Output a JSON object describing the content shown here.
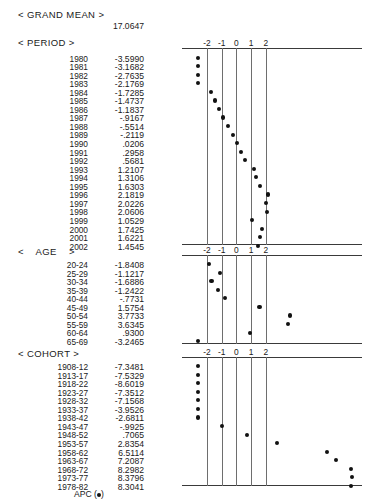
{
  "report": {
    "grand_mean_label": "< GRAND MEAN >",
    "grand_mean_value": "17.0647",
    "legend_label": "APC (",
    "legend_suffix": ")"
  },
  "axis": {
    "ticks": [
      "-2",
      "-1",
      "0",
      "1",
      "2"
    ],
    "tick_values": [
      -2,
      -1,
      0,
      1,
      2
    ],
    "min": -2,
    "max": 2
  },
  "sections": [
    {
      "title": "< PERIOD >",
      "rows": [
        {
          "label": "1980",
          "value": "-3.5990",
          "num": -3.599
        },
        {
          "label": "1981",
          "value": "-3.1682",
          "num": -3.1682
        },
        {
          "label": "1982",
          "value": "-2.7635",
          "num": -2.7635
        },
        {
          "label": "1983",
          "value": "-2.1769",
          "num": -2.1769
        },
        {
          "label": "1984",
          "value": "-1.7285",
          "num": -1.7285
        },
        {
          "label": "1985",
          "value": "-1.4737",
          "num": -1.4737
        },
        {
          "label": "1986",
          "value": "-1.1837",
          "num": -1.1837
        },
        {
          "label": "1987",
          "value": "-.9167",
          "num": -0.9167
        },
        {
          "label": "1988",
          "value": "-.5514",
          "num": -0.5514
        },
        {
          "label": "1989",
          "value": "-.2119",
          "num": -0.2119
        },
        {
          "label": "1990",
          "value": ".0206",
          "num": 0.0206
        },
        {
          "label": "1991",
          "value": ".2958",
          "num": 0.2958
        },
        {
          "label": "1992",
          "value": ".5681",
          "num": 0.5681
        },
        {
          "label": "1993",
          "value": "1.2107",
          "num": 1.2107
        },
        {
          "label": "1994",
          "value": "1.3106",
          "num": 1.3106
        },
        {
          "label": "1995",
          "value": "1.6303",
          "num": 1.6303
        },
        {
          "label": "1996",
          "value": "2.1819",
          "num": 2.1819
        },
        {
          "label": "1997",
          "value": "2.0226",
          "num": 2.0226
        },
        {
          "label": "1998",
          "value": "2.0606",
          "num": 2.0606
        },
        {
          "label": "1999",
          "value": "1.0529",
          "num": 1.0529
        },
        {
          "label": "2000",
          "value": "1.7425",
          "num": 1.7425
        },
        {
          "label": "2001",
          "value": "1.6221",
          "num": 1.6221
        },
        {
          "label": "2002",
          "value": "1.4545",
          "num": 1.4545
        }
      ]
    },
    {
      "title_left": "<",
      "title_mid": "AGE",
      "title_right": ">",
      "title": "<    AGE    >",
      "rows": [
        {
          "label": "20-24",
          "value": "-1.8408",
          "num": -1.8408
        },
        {
          "label": "25-29",
          "value": "-1.1217",
          "num": -1.1217
        },
        {
          "label": "30-34",
          "value": "-1.6886",
          "num": -1.6886
        },
        {
          "label": "35-39",
          "value": "-1.2422",
          "num": -1.2422
        },
        {
          "label": "40-44",
          "value": "-.7731",
          "num": -0.7731
        },
        {
          "label": "45-49",
          "value": "1.5754",
          "num": 1.5754
        },
        {
          "label": "50-54",
          "value": "3.7733",
          "num": 3.7733
        },
        {
          "label": "55-59",
          "value": "3.6345",
          "num": 3.6345
        },
        {
          "label": "60-64",
          "value": ".9300",
          "num": 0.93
        },
        {
          "label": "65-69",
          "value": "-3.2465",
          "num": -3.2465
        }
      ]
    },
    {
      "title": "< COHORT >",
      "rows": [
        {
          "label": "1908-12",
          "value": "-7.3481",
          "num": -7.3481
        },
        {
          "label": "1913-17",
          "value": "-7.5329",
          "num": -7.5329
        },
        {
          "label": "1918-22",
          "value": "-8.6019",
          "num": -8.6019
        },
        {
          "label": "1923-27",
          "value": "-7.3512",
          "num": -7.3512
        },
        {
          "label": "1928-32",
          "value": "-7.1568",
          "num": -7.1568
        },
        {
          "label": "1933-37",
          "value": "-3.9526",
          "num": -3.9526
        },
        {
          "label": "1938-42",
          "value": "-2.6811",
          "num": -2.6811
        },
        {
          "label": "1943-47",
          "value": "-.9925",
          "num": -0.9925
        },
        {
          "label": "1948-52",
          "value": ".7065",
          "num": 0.7065
        },
        {
          "label": "1953-57",
          "value": "2.8354",
          "num": 2.8354
        },
        {
          "label": "1958-62",
          "value": "6.5114",
          "num": 6.5114
        },
        {
          "label": "1963-67",
          "value": "7.2087",
          "num": 7.2087
        },
        {
          "label": "1968-72",
          "value": "8.2982",
          "num": 8.2982
        },
        {
          "label": "1973-77",
          "value": "8.3796",
          "num": 8.3796
        },
        {
          "label": "1978-82",
          "value": "8.3041",
          "num": 8.3041
        }
      ]
    }
  ],
  "chart_data": {
    "type": "scatter",
    "xlabel": "",
    "ylabel": "",
    "xlim": [
      -2,
      2
    ],
    "grid": true,
    "legend": "APC",
    "series": [
      {
        "name": "PERIOD",
        "categories": [
          "1980",
          "1981",
          "1982",
          "1983",
          "1984",
          "1985",
          "1986",
          "1987",
          "1988",
          "1989",
          "1990",
          "1991",
          "1992",
          "1993",
          "1994",
          "1995",
          "1996",
          "1997",
          "1998",
          "1999",
          "2000",
          "2001",
          "2002"
        ],
        "values": [
          -3.599,
          -3.1682,
          -2.7635,
          -2.1769,
          -1.7285,
          -1.4737,
          -1.1837,
          -0.9167,
          -0.5514,
          -0.2119,
          0.0206,
          0.2958,
          0.5681,
          1.2107,
          1.3106,
          1.6303,
          2.1819,
          2.0226,
          2.0606,
          1.0529,
          1.7425,
          1.6221,
          1.4545
        ]
      },
      {
        "name": "AGE",
        "categories": [
          "20-24",
          "25-29",
          "30-34",
          "35-39",
          "40-44",
          "45-49",
          "50-54",
          "55-59",
          "60-64",
          "65-69"
        ],
        "values": [
          -1.8408,
          -1.1217,
          -1.6886,
          -1.2422,
          -0.7731,
          1.5754,
          3.7733,
          3.6345,
          0.93,
          -3.2465
        ]
      },
      {
        "name": "COHORT",
        "categories": [
          "1908-12",
          "1913-17",
          "1918-22",
          "1923-27",
          "1928-32",
          "1933-37",
          "1938-42",
          "1943-47",
          "1948-52",
          "1953-57",
          "1958-62",
          "1963-67",
          "1968-72",
          "1973-77",
          "1978-82"
        ],
        "values": [
          -7.3481,
          -7.5329,
          -8.6019,
          -7.3512,
          -7.1568,
          -3.9526,
          -2.6811,
          -0.9925,
          0.7065,
          2.8354,
          6.5114,
          7.2087,
          8.2982,
          8.3796,
          8.3041
        ]
      }
    ],
    "grand_mean": 17.0647
  }
}
